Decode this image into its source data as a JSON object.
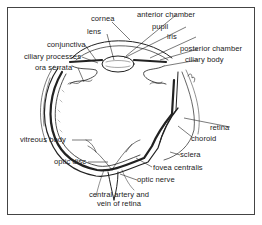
{
  "diagram": {
    "labels": {
      "cornea": "cornea",
      "anterior_chamber": "anterior chamber",
      "pupil": "pupil",
      "lens": "lens",
      "iris": "iris",
      "conjunctiva": "conjunctiva",
      "posterior_chamber": "posterior chamber",
      "ciliary_processes": "ciliary processes",
      "ciliary_body": "ciliary body",
      "ora_serrata": "ora serrata",
      "retina": "retina",
      "choroid": "choroid",
      "vitreous_body": "vitreous body",
      "sclera": "sclera",
      "optic_disc": "optic disc",
      "fovea_centralis": "fovea centralis",
      "optic_nerve": "optic nerve",
      "central_artery_line1": "central artery and",
      "central_artery_line2": "vein of retina"
    }
  }
}
